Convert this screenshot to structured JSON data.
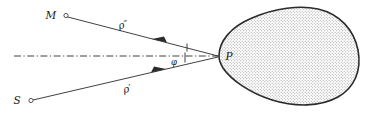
{
  "figure": {
    "background_color": "#ffffff",
    "ink_color": "#2b2b2b",
    "fill_pattern": "stipple-dots",
    "fill_color": "#f2f2f2",
    "points": [
      {
        "id": "M",
        "label": "M",
        "marker": "open-circle",
        "x": 57,
        "y": 15
      },
      {
        "id": "S",
        "label": "S",
        "marker": "open-circle",
        "x": 26,
        "y": 100
      },
      {
        "id": "P",
        "label": "P",
        "marker": "none",
        "x": 220,
        "y": 56
      }
    ],
    "rays": [
      {
        "id": "rho-double-prime",
        "label": "ρ″",
        "from": "P",
        "to": "M",
        "arrow_direction": "toward-M",
        "label_x": 124,
        "label_y": 28
      },
      {
        "id": "rho-prime",
        "label": "ρ′",
        "from": "S",
        "to": "P",
        "arrow_direction": "toward-P",
        "label_x": 128,
        "label_y": 92
      }
    ],
    "axis": {
      "id": "normal-axis",
      "style": "dash-dot",
      "x_start": 14,
      "x_end": 220,
      "y": 56
    },
    "angle": {
      "label": "φ",
      "label_x": 173,
      "label_y": 64,
      "tick_marks": 2,
      "description": "angle between incident axis and reflected ray at P"
    }
  }
}
